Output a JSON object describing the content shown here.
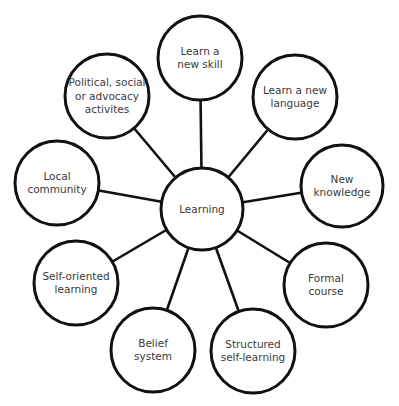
{
  "diagram": {
    "type": "mind-map",
    "center": {
      "id": "learning",
      "label": [
        "Learning"
      ],
      "x": 202,
      "y": 209,
      "r": 41
    },
    "nodes": [
      {
        "id": "learn-new-skill",
        "label": [
          "Learn a",
          "new skill"
        ],
        "x": 200,
        "y": 58,
        "r": 42
      },
      {
        "id": "learn-new-language",
        "label": [
          "Learn a new",
          "language"
        ],
        "x": 295,
        "y": 97,
        "r": 42
      },
      {
        "id": "new-knowledge",
        "label": [
          "New",
          "knowledge"
        ],
        "x": 342,
        "y": 186,
        "r": 41
      },
      {
        "id": "formal-course",
        "label": [
          "Formal",
          "course"
        ],
        "x": 326,
        "y": 285,
        "r": 42
      },
      {
        "id": "structured-self-learning",
        "label": [
          "Structured",
          "self-learning"
        ],
        "x": 253,
        "y": 351,
        "r": 42
      },
      {
        "id": "belief-system",
        "label": [
          "Belief",
          "system"
        ],
        "x": 153,
        "y": 350,
        "r": 42
      },
      {
        "id": "self-oriented-learning",
        "label": [
          "Self-oriented",
          "learning"
        ],
        "x": 76,
        "y": 283,
        "r": 42
      },
      {
        "id": "local-community",
        "label": [
          "Local",
          "community"
        ],
        "x": 57,
        "y": 183,
        "r": 42
      },
      {
        "id": "political-social-advocacy",
        "label": [
          "Political, social",
          "or advocacy",
          "activites"
        ],
        "x": 107,
        "y": 96,
        "r": 42
      }
    ],
    "colors": {
      "stroke": "#111111",
      "text": "#3a3a3a",
      "fill": "#ffffff",
      "background": "#ffffff"
    }
  }
}
